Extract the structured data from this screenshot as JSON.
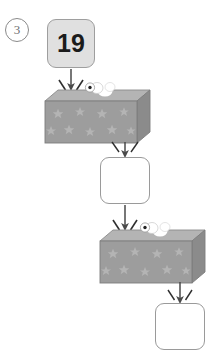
{
  "page": {
    "background_color": "#ffffff",
    "width": 213,
    "height": 357
  },
  "problem": {
    "number_label": "3",
    "number_style": "circled",
    "type": "function-machine-chain",
    "description": "Two-step function machine diagram: a starting number enters the first machine, its output enters the second machine, producing a final output."
  },
  "colors": {
    "machine_front": "#9d9d9d",
    "machine_top": "#b4b4b4",
    "machine_side": "#8b8b8b",
    "machine_star": "#b0b0b0",
    "machine_outline": "#7d7d7d",
    "box_fill": "#e0e0e0",
    "box_border": "#9e9e9e",
    "empty_box_fill": "#ffffff",
    "empty_box_border": "#9a9a9a",
    "arrow": "#4a4a4a",
    "puff": "#ffffff",
    "knob_dot": "#222222",
    "number_text": "#1b1b1b",
    "problem_number_text": "#6f6f6f"
  },
  "nodes": [
    {
      "id": "input-box",
      "role": "input-value",
      "value": "19",
      "filled": true,
      "x": 47,
      "y": 19,
      "w": 48,
      "h": 49
    },
    {
      "id": "middle-box",
      "role": "intermediate-answer",
      "value": "",
      "filled": false,
      "x": 100,
      "y": 157,
      "w": 50,
      "h": 47
    },
    {
      "id": "output-box",
      "role": "final-answer",
      "value": "",
      "filled": false,
      "x": 155,
      "y": 303,
      "w": 50,
      "h": 47
    }
  ],
  "machines": [
    {
      "id": "machine-1",
      "label": "",
      "x": 45,
      "y": 90,
      "w": 105,
      "h": 53,
      "decoration": "stars",
      "has_knob": true,
      "has_steam_puffs": true
    },
    {
      "id": "machine-2",
      "label": "",
      "x": 100,
      "y": 230,
      "w": 105,
      "h": 53,
      "decoration": "stars",
      "has_knob": true,
      "has_steam_puffs": true
    }
  ],
  "arrows": [
    {
      "id": "arrow-input-to-machine1",
      "from": "input-box",
      "to": "machine-1",
      "direction": "down",
      "has_sparks": true
    },
    {
      "id": "arrow-machine1-to-middle",
      "from": "machine-1",
      "to": "middle-box",
      "direction": "down",
      "has_sparks": true
    },
    {
      "id": "arrow-middle-to-machine2",
      "from": "middle-box",
      "to": "machine-2",
      "direction": "down",
      "has_sparks": true
    },
    {
      "id": "arrow-machine2-to-output",
      "from": "machine-2",
      "to": "output-box",
      "direction": "down",
      "has_sparks": true
    }
  ]
}
